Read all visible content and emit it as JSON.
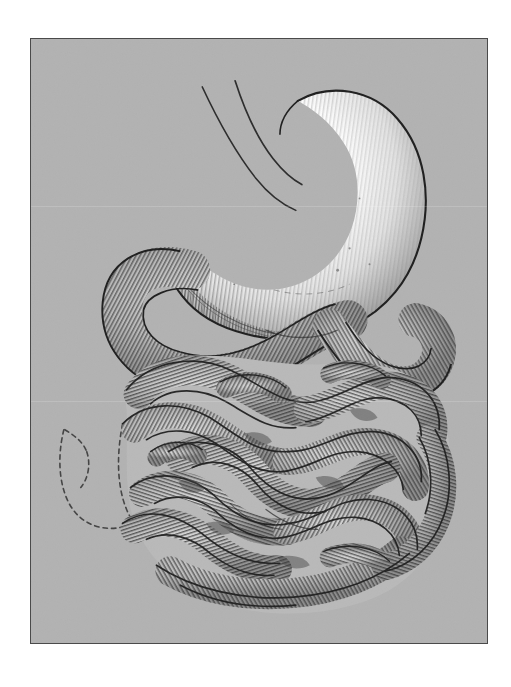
{
  "document": {
    "kind": "anatomical-engraving-plate",
    "subject": "Stomach and small intestine (gastrojejunostomy)",
    "caption": "",
    "page_background": "#ffffff",
    "plate_background": "#b2b2b2",
    "plate_border_color": "#4a4a4a",
    "ink_color": "#2b2b2b",
    "highlight_color": "#ffffff",
    "plate_rect": {
      "x": 30,
      "y": 38,
      "width": 458,
      "height": 606
    }
  },
  "figure": {
    "title": "",
    "structures": [
      {
        "id": "esophagus",
        "label": "Esophagus",
        "render": "two thin curved ink lines entering the cardia",
        "interactable": false
      },
      {
        "id": "stomach",
        "label": "Stomach",
        "render": "large white bean-shaped organ, engraved line hatching on right and lower curvature",
        "interactable": false
      },
      {
        "id": "duodenum-loop",
        "label": "Duodenum / afferent loop",
        "render": "tube arcing left and down from the greater curvature",
        "interactable": false
      },
      {
        "id": "jejunum-efferent",
        "label": "Jejunum / efferent loop",
        "render": "tube descending right from the anastomosis",
        "interactable": false
      },
      {
        "id": "small-intestine-mass",
        "label": "Small intestine coils",
        "render": "dense mass of cross-hatched intestinal loops filling lower two thirds",
        "interactable": false
      },
      {
        "id": "ghost-outline",
        "label": "Resected / displaced segment (ghost outline)",
        "render": "dashed ink outlines at lower left showing an absent loop",
        "interactable": false
      }
    ],
    "annotations": [],
    "leader_lines": []
  },
  "artifacts": {
    "scan_lines": [
      205,
      400
    ],
    "paper_texture": true
  }
}
